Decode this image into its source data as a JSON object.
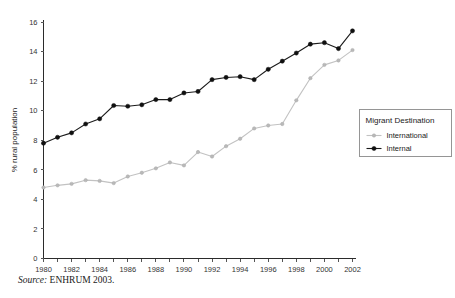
{
  "chart_data": {
    "type": "line",
    "title": "",
    "xlabel": "",
    "ylabel": "% rural population",
    "xlim": [
      1980,
      2002
    ],
    "ylim": [
      0,
      16
    ],
    "yticks": [
      0,
      2,
      4,
      6,
      8,
      10,
      12,
      14,
      16
    ],
    "xticks": [
      1980,
      1982,
      1984,
      1986,
      1988,
      1990,
      1992,
      1994,
      1996,
      1998,
      2000,
      2002
    ],
    "xtick_labels": [
      "1980",
      "1982",
      "1984",
      "1986",
      "1988",
      "1990",
      "1992",
      "1994",
      "1996",
      "1998",
      "2000",
      "2002"
    ],
    "ytick_labels": [
      "0",
      "2",
      "4",
      "6",
      "8",
      "10",
      "12",
      "14",
      "16"
    ],
    "grid": false,
    "legend_position": "right",
    "legend_title": "Migrant Destination",
    "x": [
      1980,
      1981,
      1982,
      1983,
      1984,
      1985,
      1986,
      1987,
      1988,
      1989,
      1990,
      1991,
      1992,
      1993,
      1994,
      1995,
      1996,
      1997,
      1998,
      1999,
      2000,
      2001,
      2002
    ],
    "series": [
      {
        "name": "International",
        "color": "#c2c2c2",
        "marker": "small-circle",
        "values": [
          4.8,
          4.95,
          5.05,
          5.3,
          5.25,
          5.1,
          5.55,
          5.8,
          6.1,
          6.5,
          6.3,
          7.2,
          6.9,
          7.6,
          8.1,
          8.8,
          9.0,
          9.1,
          10.7,
          12.2,
          13.1,
          13.4,
          14.1
        ]
      },
      {
        "name": "Internal",
        "color": "#1b1b1b",
        "marker": "filled-circle",
        "values": [
          7.8,
          8.2,
          8.5,
          9.1,
          9.45,
          10.35,
          10.3,
          10.4,
          10.75,
          10.75,
          11.2,
          11.3,
          12.1,
          12.25,
          12.3,
          12.1,
          12.8,
          13.35,
          13.9,
          14.5,
          14.6,
          14.2,
          15.4
        ]
      }
    ]
  },
  "caption": {
    "source_keyword": "Source:",
    "source_text": " ENHRUM 2003."
  }
}
